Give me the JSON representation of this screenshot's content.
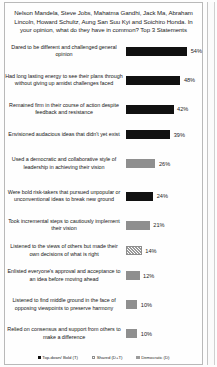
{
  "chart_data": {
    "type": "bar",
    "title": "Nelson Mandela, Steve Jobs, Mahatma Gandhi, Jack Ma, Abraham Lincoln, Howard Schultz, Aung San Suu Kyi and Soichiro Honda. In your opinion, what do they have in common? Top 3 Statements",
    "xlabel": "",
    "ylabel": "",
    "xlim": [
      0,
      60
    ],
    "grid": false,
    "orientation": "horizontal",
    "legend_position": "bottom",
    "categories": [
      "Dared to be different and challenged general opinion",
      "Had long lasting energy to see their plans through without giving up amidst challenges faced",
      "Remained firm in their course of action despite feedback and resistance",
      "Envisioned audacious ideas that didn't yet exist",
      "Used a democratic and collaborative style of leadership in achieving their vision",
      "Were bold risk-takers that pursued unpopular or unconventional ideas to break new ground",
      "Took incremental steps to cautiously implement their vision",
      "Listened to the views of others but made their own decisions of what is right",
      "Enlisted everyone's approval and acceptance to an idea before moving ahead",
      "Listened to find middle ground in the face of opposing viewpoints to preserve harmony",
      "Relied on consensus and support from others to make a difference"
    ],
    "values": [
      54,
      48,
      42,
      39,
      26,
      24,
      21,
      14,
      12,
      10,
      10
    ],
    "value_labels": [
      "54%",
      "48%",
      "42%",
      "39%",
      "26%",
      "24%",
      "21%",
      "14%",
      "12%",
      "10%",
      "10%"
    ],
    "point_groups": [
      "T",
      "T",
      "T",
      "T",
      "D",
      "T",
      "D",
      "D+T",
      "D",
      "D",
      "D"
    ],
    "legend": [
      {
        "key": "T",
        "label": "Top-down/ Bold (T)",
        "color": "#111111"
      },
      {
        "key": "D+T",
        "label": "Shared (D+T)",
        "color": "#9a9a9a"
      },
      {
        "key": "D",
        "label": "Democratic (D)",
        "color": "#9b9b9b"
      }
    ]
  }
}
